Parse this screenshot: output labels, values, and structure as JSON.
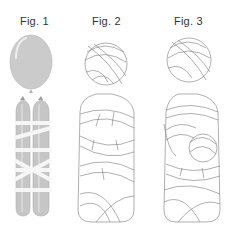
{
  "figures": [
    {
      "label": "Fig. 1",
      "subject": "round-balloon-over-two-long-balloons-wrapped-with-white-bands"
    },
    {
      "label": "Fig. 2",
      "subject": "mummy-wrapped-figure-front"
    },
    {
      "label": "Fig. 3",
      "subject": "mummy-wrapped-figure-with-arms"
    }
  ],
  "colors": {
    "balloon_fill": "#c9c9c9",
    "balloon_highlight": "#e4e4e4",
    "band": "#f6f6f6",
    "outline": "#7a7a7a",
    "label": "#333333"
  }
}
